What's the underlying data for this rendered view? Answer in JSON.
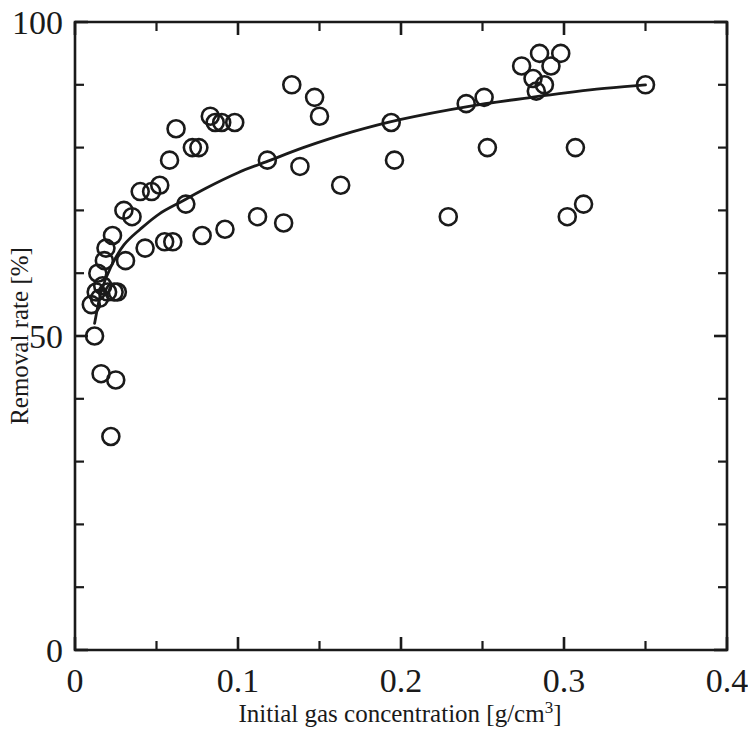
{
  "chart_data": {
    "type": "scatter",
    "title": "",
    "xlabel": "Initial gas concentration [g/cm3]",
    "xlabel_base": "Initial gas concentration [g/cm",
    "xlabel_sup": "3",
    "xlabel_tail": "]",
    "ylabel": "Removal rate [%]",
    "xlim": [
      0,
      0.4
    ],
    "ylim": [
      0,
      100
    ],
    "grid": false,
    "legend": null,
    "marker_style": "open-circle",
    "xticks": [
      0,
      0.1,
      0.2,
      0.3,
      0.4
    ],
    "xtick_labels": [
      "0",
      "0.1",
      "0.2",
      "0.3",
      "0.4"
    ],
    "xminor_step": 0.05,
    "yticks": [
      0,
      50,
      100
    ],
    "ytick_labels": [
      "0",
      "50",
      "100"
    ],
    "yminor_step": 10,
    "points": [
      {
        "x": 0.01,
        "y": 55
      },
      {
        "x": 0.012,
        "y": 50
      },
      {
        "x": 0.013,
        "y": 57
      },
      {
        "x": 0.014,
        "y": 60
      },
      {
        "x": 0.015,
        "y": 56
      },
      {
        "x": 0.016,
        "y": 44
      },
      {
        "x": 0.017,
        "y": 58
      },
      {
        "x": 0.018,
        "y": 62
      },
      {
        "x": 0.019,
        "y": 64
      },
      {
        "x": 0.02,
        "y": 57
      },
      {
        "x": 0.022,
        "y": 34
      },
      {
        "x": 0.023,
        "y": 66
      },
      {
        "x": 0.024,
        "y": 57
      },
      {
        "x": 0.025,
        "y": 43
      },
      {
        "x": 0.026,
        "y": 57
      },
      {
        "x": 0.03,
        "y": 70
      },
      {
        "x": 0.031,
        "y": 62
      },
      {
        "x": 0.035,
        "y": 69
      },
      {
        "x": 0.04,
        "y": 73
      },
      {
        "x": 0.043,
        "y": 64
      },
      {
        "x": 0.047,
        "y": 73
      },
      {
        "x": 0.052,
        "y": 74
      },
      {
        "x": 0.055,
        "y": 65
      },
      {
        "x": 0.058,
        "y": 78
      },
      {
        "x": 0.06,
        "y": 65
      },
      {
        "x": 0.062,
        "y": 83
      },
      {
        "x": 0.068,
        "y": 71
      },
      {
        "x": 0.072,
        "y": 80
      },
      {
        "x": 0.076,
        "y": 80
      },
      {
        "x": 0.078,
        "y": 66
      },
      {
        "x": 0.083,
        "y": 85
      },
      {
        "x": 0.086,
        "y": 84
      },
      {
        "x": 0.09,
        "y": 84
      },
      {
        "x": 0.092,
        "y": 67
      },
      {
        "x": 0.098,
        "y": 84
      },
      {
        "x": 0.112,
        "y": 69
      },
      {
        "x": 0.118,
        "y": 78
      },
      {
        "x": 0.128,
        "y": 68
      },
      {
        "x": 0.133,
        "y": 90
      },
      {
        "x": 0.138,
        "y": 77
      },
      {
        "x": 0.147,
        "y": 88
      },
      {
        "x": 0.15,
        "y": 85
      },
      {
        "x": 0.163,
        "y": 74
      },
      {
        "x": 0.194,
        "y": 84
      },
      {
        "x": 0.196,
        "y": 78
      },
      {
        "x": 0.229,
        "y": 69
      },
      {
        "x": 0.24,
        "y": 87
      },
      {
        "x": 0.251,
        "y": 88
      },
      {
        "x": 0.253,
        "y": 80
      },
      {
        "x": 0.274,
        "y": 93
      },
      {
        "x": 0.281,
        "y": 91
      },
      {
        "x": 0.283,
        "y": 89
      },
      {
        "x": 0.285,
        "y": 95
      },
      {
        "x": 0.288,
        "y": 90
      },
      {
        "x": 0.292,
        "y": 93
      },
      {
        "x": 0.298,
        "y": 95
      },
      {
        "x": 0.302,
        "y": 69
      },
      {
        "x": 0.307,
        "y": 80
      },
      {
        "x": 0.312,
        "y": 71
      },
      {
        "x": 0.35,
        "y": 90
      }
    ],
    "fit_curve": {
      "label": "fitted trend",
      "points": [
        {
          "x": 0.012,
          "y": 52.0
        },
        {
          "x": 0.016,
          "y": 57.0
        },
        {
          "x": 0.022,
          "y": 61.0
        },
        {
          "x": 0.03,
          "y": 64.5
        },
        {
          "x": 0.04,
          "y": 67.0
        },
        {
          "x": 0.052,
          "y": 69.5
        },
        {
          "x": 0.066,
          "y": 71.5
        },
        {
          "x": 0.08,
          "y": 73.5
        },
        {
          "x": 0.1,
          "y": 76.0
        },
        {
          "x": 0.12,
          "y": 78.0
        },
        {
          "x": 0.14,
          "y": 80.0
        },
        {
          "x": 0.17,
          "y": 82.5
        },
        {
          "x": 0.2,
          "y": 84.5
        },
        {
          "x": 0.24,
          "y": 86.5
        },
        {
          "x": 0.28,
          "y": 88.0
        },
        {
          "x": 0.32,
          "y": 89.3
        },
        {
          "x": 0.35,
          "y": 90.0
        }
      ]
    }
  }
}
